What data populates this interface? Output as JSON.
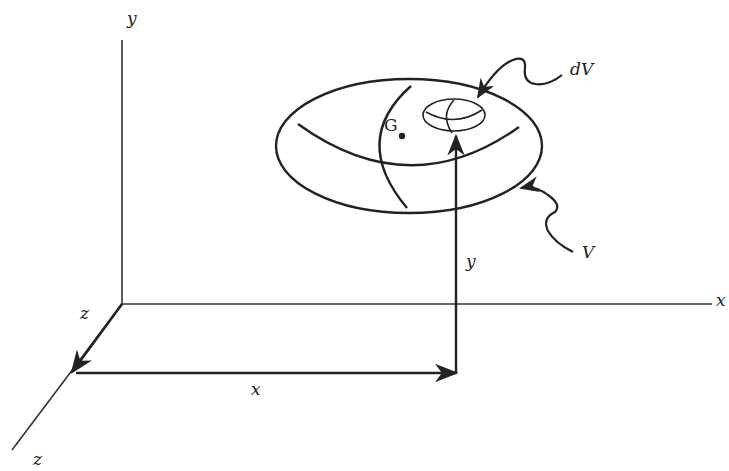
{
  "diagram": {
    "axes": {
      "x_label": "x",
      "y_label": "y",
      "z_label": "z"
    },
    "labels": {
      "z_near": "z",
      "z_far": "z",
      "x_axis": "x",
      "y_axis": "y",
      "x_dim": "x",
      "y_dim": "y",
      "centroid": "G",
      "element": "dV",
      "volume": "V"
    },
    "colors": {
      "ink": "#222222",
      "background": "#ffffff"
    }
  }
}
